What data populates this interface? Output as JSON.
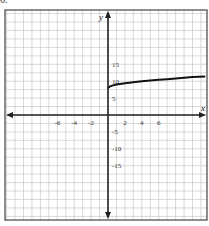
{
  "header_fragment": "6.",
  "chart_data": {
    "type": "line",
    "title": "",
    "xlabel": "x",
    "ylabel": "y",
    "x_ticks": [
      -6,
      -4,
      -2,
      2,
      4,
      6
    ],
    "y_ticks": [
      15,
      10,
      5,
      -5,
      -10,
      -15
    ],
    "xlim": [
      -12,
      11.5
    ],
    "ylim": [
      -26,
      26
    ],
    "grid": true,
    "grid_x_step": 1,
    "grid_y_step": 2.5,
    "series": [
      {
        "name": "curve",
        "x": [
          0,
          0.25,
          0.5,
          1,
          2,
          3,
          4,
          5,
          6,
          7,
          8,
          9,
          10,
          11.5
        ],
        "y": [
          8,
          8.5,
          8.7,
          9,
          9.4,
          9.7,
          10,
          10.2,
          10.4,
          10.6,
          10.8,
          11,
          11.2,
          11.4
        ]
      }
    ]
  },
  "colors": {
    "grid": "#c8c8c8",
    "axis": "#222222",
    "curve": "#111111",
    "frame": "#444444"
  }
}
